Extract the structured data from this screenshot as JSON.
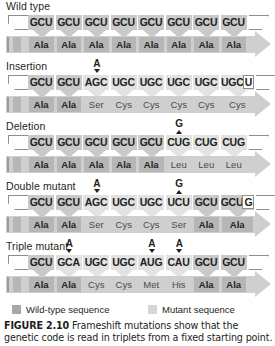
{
  "figure": {
    "caption_label": "FIGURE 2.10",
    "caption_text": "Frameshift mutations show that the genetic code is read in triplets from a fixed starting point."
  },
  "legend": {
    "wild_type": "Wild-type sequence",
    "mutant": "Mutant sequence",
    "wild_type_color": "#a8a8a8",
    "mutant_color": "#d6d6d6"
  },
  "panels": [
    {
      "label": "Wild type",
      "markers": [],
      "codons": [
        {
          "text": "GCU",
          "type": "wt"
        },
        {
          "text": "GCU",
          "type": "wt"
        },
        {
          "text": "GCU",
          "type": "wt"
        },
        {
          "text": "GCU",
          "type": "wt"
        },
        {
          "text": "GCU",
          "type": "wt"
        },
        {
          "text": "GCU",
          "type": "wt"
        },
        {
          "text": "GCU",
          "type": "wt"
        },
        {
          "text": "GCU",
          "type": "wt"
        }
      ],
      "amino_acids": [
        {
          "text": "Ala",
          "type": "wt"
        },
        {
          "text": "Ala",
          "type": "wt"
        },
        {
          "text": "Ala",
          "type": "wt"
        },
        {
          "text": "Ala",
          "type": "wt"
        },
        {
          "text": "Ala",
          "type": "wt"
        },
        {
          "text": "Ala",
          "type": "wt"
        },
        {
          "text": "Ala",
          "type": "wt"
        },
        {
          "text": "Ala",
          "type": "wt"
        }
      ]
    },
    {
      "label": "Insertion",
      "markers": [
        {
          "base": "A",
          "kind": "insertion",
          "codon_index": 2
        }
      ],
      "codons": [
        {
          "text": "GCU",
          "type": "wt"
        },
        {
          "text": "GCU",
          "type": "wt"
        },
        {
          "text": "AGC",
          "type": "mu"
        },
        {
          "text": "UGC",
          "type": "mu"
        },
        {
          "text": "UGC",
          "type": "mu"
        },
        {
          "text": "UGC",
          "type": "mu"
        },
        {
          "text": "UGC",
          "type": "mu"
        },
        {
          "text": "UGCU",
          "type": "mu"
        }
      ],
      "amino_acids": [
        {
          "text": "Ala",
          "type": "wt"
        },
        {
          "text": "Ala",
          "type": "wt"
        },
        {
          "text": "Ser",
          "type": "mu"
        },
        {
          "text": "Cys",
          "type": "mu"
        },
        {
          "text": "Cys",
          "type": "mu"
        },
        {
          "text": "Cys",
          "type": "mu"
        },
        {
          "text": "Cys",
          "type": "mu"
        },
        {
          "text": "Cys",
          "type": "mu"
        }
      ]
    },
    {
      "label": "Deletion",
      "markers": [
        {
          "base": "G",
          "kind": "deletion",
          "codon_index": 5
        }
      ],
      "codons": [
        {
          "text": "GCU",
          "type": "wt"
        },
        {
          "text": "GCU",
          "type": "wt"
        },
        {
          "text": "GCU",
          "type": "wt"
        },
        {
          "text": "GCU",
          "type": "wt"
        },
        {
          "text": "GCU",
          "type": "wt"
        },
        {
          "text": "CUG",
          "type": "mu"
        },
        {
          "text": "CUG",
          "type": "mu"
        },
        {
          "text": "CUG",
          "type": "mu"
        }
      ],
      "amino_acids": [
        {
          "text": "Ala",
          "type": "wt"
        },
        {
          "text": "Ala",
          "type": "wt"
        },
        {
          "text": "Ala",
          "type": "wt"
        },
        {
          "text": "Ala",
          "type": "wt"
        },
        {
          "text": "Ala",
          "type": "wt"
        },
        {
          "text": "Leu",
          "type": "mu"
        },
        {
          "text": "Leu",
          "type": "mu"
        },
        {
          "text": "Leu",
          "type": "mu"
        }
      ]
    },
    {
      "label": "Double mutant",
      "markers": [
        {
          "base": "A",
          "kind": "insertion",
          "codon_index": 2
        },
        {
          "base": "G",
          "kind": "deletion",
          "codon_index": 5
        }
      ],
      "codons": [
        {
          "text": "GCU",
          "type": "wt"
        },
        {
          "text": "GCU",
          "type": "wt"
        },
        {
          "text": "AGC",
          "type": "mu"
        },
        {
          "text": "UGC",
          "type": "mu"
        },
        {
          "text": "UGC",
          "type": "mu"
        },
        {
          "text": "UCU",
          "type": "mu"
        },
        {
          "text": "GCU",
          "type": "wt"
        },
        {
          "text": "GCUG",
          "type": "wt"
        }
      ],
      "amino_acids": [
        {
          "text": "Ala",
          "type": "wt"
        },
        {
          "text": "Ala",
          "type": "wt"
        },
        {
          "text": "Ser",
          "type": "mu"
        },
        {
          "text": "Cys",
          "type": "mu"
        },
        {
          "text": "Cys",
          "type": "mu"
        },
        {
          "text": "Ser",
          "type": "mu"
        },
        {
          "text": "Ala",
          "type": "wt"
        },
        {
          "text": "Ala",
          "type": "wt"
        }
      ]
    },
    {
      "label": "Triple mutant",
      "markers": [
        {
          "base": "A",
          "kind": "insertion",
          "codon_index": 1
        },
        {
          "base": "A",
          "kind": "insertion",
          "codon_index": 4
        },
        {
          "base": "A",
          "kind": "insertion",
          "codon_index": 5
        }
      ],
      "codons": [
        {
          "text": "GCU",
          "type": "wt"
        },
        {
          "text": "GCA",
          "type": "mu"
        },
        {
          "text": "UGC",
          "type": "mu"
        },
        {
          "text": "UGC",
          "type": "mu"
        },
        {
          "text": "AUG",
          "type": "mu"
        },
        {
          "text": "CAU",
          "type": "mu"
        },
        {
          "text": "GCU",
          "type": "wt"
        },
        {
          "text": "GCU",
          "type": "wt"
        }
      ],
      "amino_acids": [
        {
          "text": "Ala",
          "type": "wt"
        },
        {
          "text": "Ala",
          "type": "wt"
        },
        {
          "text": "Cys",
          "type": "mu"
        },
        {
          "text": "Cys",
          "type": "mu"
        },
        {
          "text": "Met",
          "type": "mu"
        },
        {
          "text": "His",
          "type": "mu"
        },
        {
          "text": "Ala",
          "type": "wt"
        },
        {
          "text": "Ala",
          "type": "wt"
        }
      ]
    }
  ]
}
